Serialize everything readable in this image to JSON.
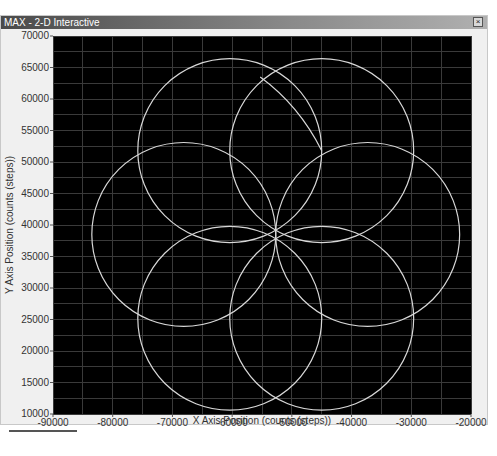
{
  "window": {
    "title": "MAX - 2-D Interactive",
    "close_label": "×"
  },
  "colors": {
    "plot_background": "#000000",
    "grid": "#3a3a3a",
    "trace": "#d8d8d8",
    "titlebar_start": "#4a4a4a",
    "window_bg": "#f0f0f0"
  },
  "chart_data": {
    "type": "line",
    "title": "MAX - 2-D Interactive",
    "xlabel": "X Axis Position (counts (steps))",
    "ylabel": "Y Axis Position (counts (steps))",
    "xlim": [
      -90000,
      -20000
    ],
    "ylim": [
      10000,
      70000
    ],
    "x_ticks": [
      -90000,
      -80000,
      -70000,
      -60000,
      -50000,
      -40000,
      -30000,
      -20000
    ],
    "y_ticks": [
      10000,
      15000,
      20000,
      25000,
      30000,
      35000,
      40000,
      45000,
      50000,
      55000,
      60000,
      65000,
      70000
    ],
    "x_tick_labels": [
      "-90000",
      "-80000",
      "-70000",
      "-60000",
      "-50000",
      "-40000",
      "-30000",
      "-20000"
    ],
    "y_tick_labels": [
      "10000",
      "15000",
      "20000",
      "25000",
      "30000",
      "35000",
      "40000",
      "45000",
      "50000",
      "55000",
      "60000",
      "65000",
      "70000"
    ],
    "grid": true,
    "minor_grid_x_step": 5000,
    "minor_grid_y_step": 2500,
    "legend": null,
    "pattern_center": {
      "x": -52700,
      "y": 38500
    },
    "circle_radius_x_counts": 15400,
    "series": [
      {
        "name": "circle-1",
        "shape": "circle",
        "center": {
          "x": -37300,
          "y": 38500
        },
        "radius": 15400
      },
      {
        "name": "circle-2",
        "shape": "circle",
        "center": {
          "x": -45000,
          "y": 51800
        },
        "radius": 15400
      },
      {
        "name": "circle-3",
        "shape": "circle",
        "center": {
          "x": -60400,
          "y": 51800
        },
        "radius": 15400
      },
      {
        "name": "circle-4",
        "shape": "circle",
        "center": {
          "x": -68100,
          "y": 38500
        },
        "radius": 15400
      },
      {
        "name": "circle-5",
        "shape": "circle",
        "center": {
          "x": -60400,
          "y": 25200
        },
        "radius": 15400
      },
      {
        "name": "circle-6",
        "shape": "circle",
        "center": {
          "x": -45000,
          "y": 25200
        },
        "radius": 15400
      },
      {
        "name": "partial-arc",
        "shape": "arc",
        "points": [
          {
            "x": -55300,
            "y": 63500
          },
          {
            "x": -48800,
            "y": 59000
          },
          {
            "x": -45000,
            "y": 51800
          }
        ]
      }
    ]
  },
  "plot_px": {
    "left": 52,
    "top": 20,
    "right": 470,
    "bottom": 398
  }
}
